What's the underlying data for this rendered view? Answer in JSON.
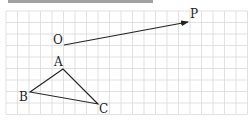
{
  "figure": {
    "top_text_fragment": "",
    "grid": {
      "x0": 6,
      "y0": 11,
      "cell": 11.5,
      "cols": 21,
      "rows": 9,
      "line_color": "#d9d9d9"
    },
    "vector": {
      "from": {
        "label": "O",
        "x": 64,
        "y": 45
      },
      "to": {
        "label": "P",
        "x": 188,
        "y": 22
      },
      "color": "#222222"
    },
    "triangle": {
      "color": "#222222",
      "vertices": [
        {
          "label": "A",
          "x": 63,
          "y": 69
        },
        {
          "label": "B",
          "x": 30,
          "y": 92
        },
        {
          "label": "C",
          "x": 98,
          "y": 104
        }
      ]
    },
    "labels": {
      "O": "O",
      "P": "P",
      "A": "A",
      "B": "B",
      "C": "C"
    }
  }
}
